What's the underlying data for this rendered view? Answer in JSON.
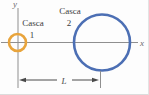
{
  "figure": {
    "axis_labels": {
      "x": "x",
      "y": "y"
    },
    "shells": [
      {
        "name": "Casca",
        "number": "1",
        "color": "#e8a43c"
      },
      {
        "name": "Casca",
        "number": "2",
        "color": "#4c6fb4"
      }
    ],
    "dimension": {
      "label": "L"
    },
    "colors": {
      "axis": "#8f8f8f",
      "text": "#3b3b3b",
      "axis_text": "#6b6b6b",
      "dimension": "#4a4a4a"
    }
  }
}
